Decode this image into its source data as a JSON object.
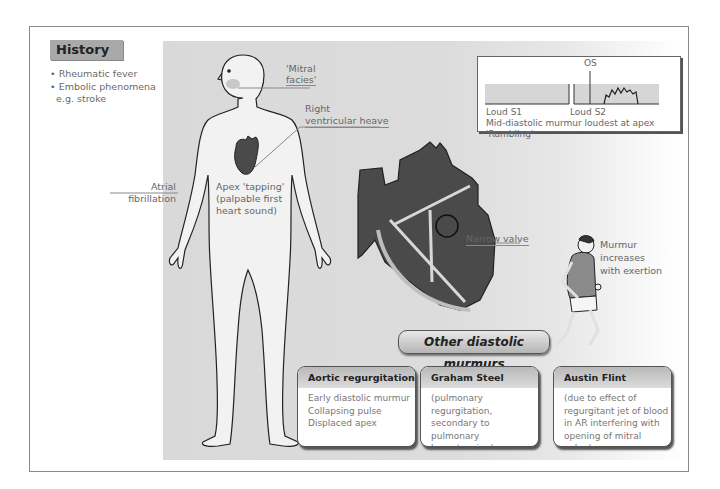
{
  "history": {
    "title": "History",
    "items": [
      "Rheumatic fever",
      "Embolic phenomena",
      "e.g. stroke"
    ]
  },
  "body_labels": {
    "mitral_facies_1": "'Mitral",
    "mitral_facies_2": "facies'",
    "rv_heave_1": "Right",
    "rv_heave_2": "ventricular heave",
    "af_1": "Atrial",
    "af_2": "fibrillation",
    "apex_1": "Apex 'tapping'",
    "apex_2": "(palpable first",
    "apex_3": "heart sound)"
  },
  "heart": {
    "narrow_valve": "Narrow valve"
  },
  "runner": {
    "line1": "Murmur",
    "line2": "increases",
    "line3": "with exertion"
  },
  "phonocardiogram": {
    "os_label": "OS",
    "s1_label": "Loud S1",
    "s2_label": "Loud S2",
    "caption_1": "Mid-diastolic murmur loudest at apex",
    "caption_2": "'Rumbling'"
  },
  "other_murmurs": {
    "title": "Other diastolic murmurs",
    "cards": [
      {
        "title": "Aortic regurgitation",
        "lines": [
          "Early diastolic murmur",
          "Collapsing pulse",
          "Displaced apex"
        ]
      },
      {
        "title": "Graham Steel",
        "lines": [
          "(pulmonary regurgitation,",
          "secondary to pulmonary",
          "hypertension)"
        ]
      },
      {
        "title": "Austin Flint",
        "lines": [
          "(due to effect of",
          "regurgitant jet of blood",
          "in AR interfering with",
          "opening of mitral valve)"
        ]
      }
    ]
  },
  "colors": {
    "panel_grey": "#d9d9d9",
    "heart_dark": "#4a4a4a",
    "header_grey": "#a9a9a9"
  }
}
